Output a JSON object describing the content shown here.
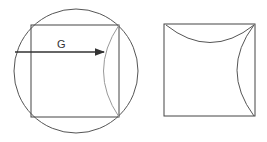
{
  "figure_left": {
    "label": "G",
    "shapes": [
      "circle",
      "inscribed-square",
      "arrow",
      "arc"
    ]
  },
  "figure_right": {
    "shapes": [
      "square",
      "top-arc",
      "right-arc"
    ]
  },
  "colors": {
    "stroke": "#444444",
    "arc": "#888888",
    "background": "#ffffff"
  }
}
